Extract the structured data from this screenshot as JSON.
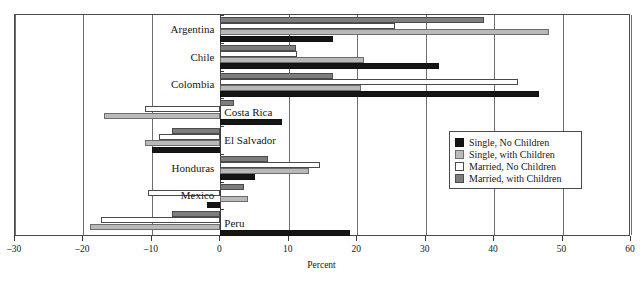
{
  "chart_data": {
    "type": "bar",
    "orientation": "horizontal",
    "title": "",
    "xlabel": "Percent",
    "ylabel": "",
    "xlim": [
      -30,
      60
    ],
    "xticks": [
      -30,
      -20,
      -10,
      0,
      10,
      20,
      30,
      40,
      50,
      60
    ],
    "xtick_labels": [
      "–30",
      "–20",
      "–10",
      "0",
      "10",
      "20",
      "30",
      "40",
      "50",
      "60"
    ],
    "grid": true,
    "legend_position": "center-right",
    "categories": [
      "Argentina",
      "Chile",
      "Colombia",
      "Costa Rica",
      "El Salvador",
      "Honduras",
      "Mexico",
      "Peru"
    ],
    "series": [
      {
        "name": "Married, with Children",
        "key": "m-wc",
        "color": "#7d7d7d",
        "values": [
          38.5,
          11.0,
          16.5,
          2.0,
          -7.0,
          7.0,
          3.5,
          -7.0
        ]
      },
      {
        "name": "Married, No Children",
        "key": "m-noc",
        "color": "#ffffff",
        "values": [
          25.5,
          11.2,
          43.5,
          -11.0,
          -9.0,
          14.5,
          -10.5,
          -17.5
        ]
      },
      {
        "name": "Single, with Children",
        "key": "s-wc",
        "color": "#b9b9b9",
        "values": [
          48.0,
          21.0,
          20.5,
          -17.0,
          -11.0,
          13.0,
          4.0,
          -19.0
        ]
      },
      {
        "name": "Single, No Children",
        "key": "s-noc",
        "color": "#151515",
        "values": [
          16.5,
          32.0,
          46.5,
          9.0,
          -10.0,
          5.0,
          -2.0,
          19.0
        ]
      }
    ]
  },
  "legend": {
    "items": [
      {
        "label": "Single, No Children",
        "key": "s-noc"
      },
      {
        "label": "Single, with Children",
        "key": "s-wc"
      },
      {
        "label": "Married, No Children",
        "key": "m-noc"
      },
      {
        "label": "Married, with Children",
        "key": "m-wc"
      }
    ]
  },
  "axis": {
    "title": "Percent"
  },
  "caption_fragment": ""
}
